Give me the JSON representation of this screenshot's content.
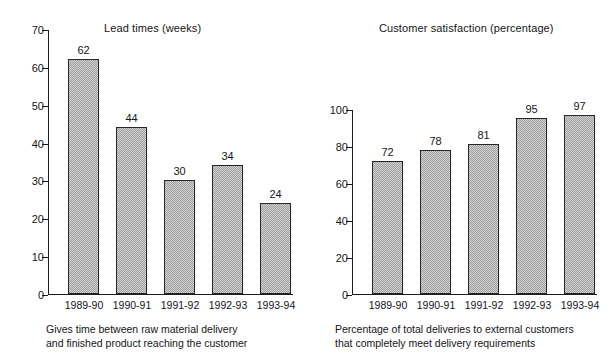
{
  "chart_data": [
    {
      "type": "bar",
      "title": "Lead times (weeks)",
      "categories": [
        "1989-90",
        "1990-91",
        "1991-92",
        "1992-93",
        "1993-94"
      ],
      "values": [
        62,
        44,
        30,
        34,
        24
      ],
      "data_labels": [
        "62",
        "44",
        "30",
        "34",
        "24"
      ],
      "xlabel": "",
      "ylabel": "",
      "ylim": [
        0,
        70
      ],
      "ytick_values": [
        0,
        10,
        20,
        30,
        40,
        50,
        60,
        70
      ],
      "ytick_labels": [
        "0",
        "10",
        "20",
        "30",
        "40",
        "50",
        "60",
        "70"
      ],
      "grid": false,
      "legend": false,
      "bar_color": "#9d9d9d",
      "bar_edge_color": "#262626",
      "caption_lines": [
        "Gives time between raw material delivery",
        "and finished product reaching the customer"
      ]
    },
    {
      "type": "bar",
      "title": "Customer satisfaction (percentage)",
      "categories": [
        "1989-90",
        "1990-91",
        "1991-92",
        "1992-93",
        "1993-94"
      ],
      "values": [
        72,
        78,
        81,
        95,
        97
      ],
      "data_labels": [
        "72",
        "78",
        "81",
        "95",
        "97"
      ],
      "xlabel": "",
      "ylabel": "",
      "ylim": [
        0,
        100
      ],
      "ytick_values": [
        0,
        20,
        40,
        60,
        80,
        100
      ],
      "ytick_labels": [
        "0",
        "20",
        "40",
        "60",
        "80",
        "100"
      ],
      "grid": false,
      "legend": false,
      "bar_color": "#9d9d9d",
      "bar_edge_color": "#262626",
      "caption_lines": [
        "Percentage of total deliveries to external customers",
        "that completely meet delivery requirements"
      ]
    }
  ]
}
